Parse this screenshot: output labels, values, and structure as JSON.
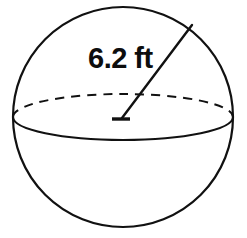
{
  "figure": {
    "name": "sphere-with-radius",
    "background_color": "#ffffff",
    "stroke_color": "#111111"
  },
  "sphere": {
    "outline_name": "sphere-outline-circle",
    "center_x": 123,
    "center_y": 117,
    "radius": 110,
    "stroke_width": 2.2
  },
  "equator": {
    "name": "equator-ellipse",
    "center_x": 123,
    "center_y": 117,
    "radius_x": 110,
    "radius_y": 23,
    "front_style": "solid",
    "back_style": "dashed",
    "dash_pattern": "9 7",
    "stroke_width": 2.0
  },
  "radius_line": {
    "name": "radius-leader-line",
    "from_x": 122,
    "from_y": 118,
    "to_x": 192,
    "to_y": 25,
    "stroke_width": 2.4,
    "center_tick": {
      "name": "center-point-tick",
      "x1": 112,
      "y1": 119,
      "x2": 130,
      "y2": 119,
      "stroke_width": 3.4
    }
  },
  "label": {
    "name": "radius-dimension-label",
    "text": "6.2 ft",
    "value": "6.2",
    "unit": "ft",
    "x": 88,
    "y": 68,
    "font_size": 29,
    "color": "#0d0d0d"
  }
}
